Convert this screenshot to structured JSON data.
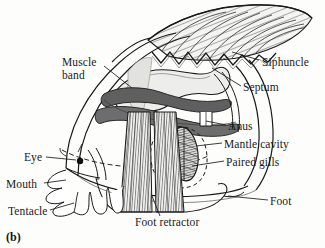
{
  "figure": {
    "panel_label": "(b)",
    "background_color": "#fdfdfc",
    "ink_color": "#1a1a1a"
  },
  "labels": {
    "muscle_band_line1": "Muscle",
    "muscle_band_line2": "band",
    "siphuncle": "Siphuncle",
    "septum": "Septum",
    "anus": "Anus",
    "mantle_cavity": "Mantle cavity",
    "paired_gills": "Paired gills",
    "foot": "Foot",
    "foot_retractor": "Foot retractor",
    "eye": "Eye",
    "mouth": "Mouth",
    "tentacle": "Tentacle"
  },
  "parts": [
    {
      "name": "shell-chambers",
      "label": "Siphuncle",
      "fill": "#f2f2f0"
    },
    {
      "name": "septum-suture",
      "label": "Septum",
      "fill": "none"
    },
    {
      "name": "muscle-band",
      "label": "Muscle band",
      "fill": "#6b6b6b"
    },
    {
      "name": "visceral-mass",
      "label": "",
      "fill": "#e8e8e6"
    },
    {
      "name": "anus-tube",
      "label": "Anus",
      "fill": "#ffffff"
    },
    {
      "name": "mantle-cavity",
      "label": "Mantle cavity",
      "fill": "none"
    },
    {
      "name": "paired-gills",
      "label": "Paired gills",
      "fill": "#d8d8d5"
    },
    {
      "name": "foot-retractor",
      "label": "Foot retractor",
      "fill": "#ededeb"
    },
    {
      "name": "foot",
      "label": "Foot",
      "fill": "#ffffff"
    },
    {
      "name": "eye",
      "label": "Eye",
      "fill": "#111111"
    },
    {
      "name": "mouth",
      "label": "Mouth",
      "fill": "#ffffff"
    },
    {
      "name": "tentacle",
      "label": "Tentacle",
      "fill": "#ffffff"
    }
  ]
}
